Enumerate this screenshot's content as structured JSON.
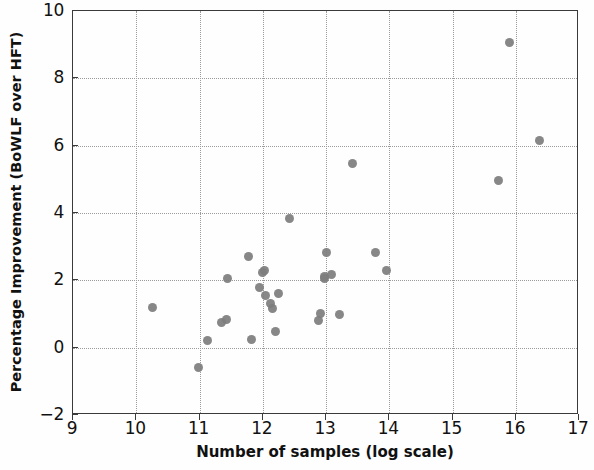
{
  "chart_data": {
    "type": "scatter",
    "title": "",
    "xlabel": "Number of samples (log scale)",
    "ylabel": "Percentage Improvement (BoWLF over HFT)",
    "xlim": [
      9,
      17
    ],
    "ylim": [
      -2,
      10
    ],
    "xticks": [
      9,
      10,
      11,
      12,
      13,
      14,
      15,
      16,
      17
    ],
    "yticks": [
      -2,
      0,
      2,
      4,
      6,
      8,
      10
    ],
    "xtick_labels": [
      "9",
      "10",
      "11",
      "12",
      "13",
      "14",
      "15",
      "16",
      "17"
    ],
    "ytick_labels": [
      "-2",
      "0",
      "2",
      "4",
      "6",
      "8",
      "10"
    ],
    "grid": true,
    "grid_style": "dotted",
    "legend": null,
    "marker": {
      "shape": "circle",
      "color": "#7d7d7d",
      "size": 9
    },
    "points": [
      {
        "x": 10.25,
        "y": 1.2
      },
      {
        "x": 10.98,
        "y": -0.6
      },
      {
        "x": 11.12,
        "y": 0.2
      },
      {
        "x": 11.35,
        "y": 0.75
      },
      {
        "x": 11.42,
        "y": 0.85
      },
      {
        "x": 11.45,
        "y": 2.05
      },
      {
        "x": 11.78,
        "y": 2.7
      },
      {
        "x": 11.82,
        "y": 0.25
      },
      {
        "x": 11.95,
        "y": 1.78
      },
      {
        "x": 12.0,
        "y": 2.22
      },
      {
        "x": 12.02,
        "y": 2.3
      },
      {
        "x": 12.05,
        "y": 1.55
      },
      {
        "x": 12.13,
        "y": 1.3
      },
      {
        "x": 12.15,
        "y": 1.15
      },
      {
        "x": 12.2,
        "y": 0.48
      },
      {
        "x": 12.25,
        "y": 1.62
      },
      {
        "x": 12.42,
        "y": 3.85
      },
      {
        "x": 12.88,
        "y": 0.82
      },
      {
        "x": 12.92,
        "y": 1.02
      },
      {
        "x": 12.97,
        "y": 2.05
      },
      {
        "x": 12.98,
        "y": 2.12
      },
      {
        "x": 13.0,
        "y": 2.82
      },
      {
        "x": 13.08,
        "y": 2.18
      },
      {
        "x": 13.22,
        "y": 0.98
      },
      {
        "x": 13.42,
        "y": 5.48
      },
      {
        "x": 13.78,
        "y": 2.82
      },
      {
        "x": 13.95,
        "y": 2.28
      },
      {
        "x": 15.72,
        "y": 4.98
      },
      {
        "x": 15.9,
        "y": 9.05
      },
      {
        "x": 16.38,
        "y": 6.15
      }
    ]
  },
  "axes": {
    "frame_color": "#3a3a3a",
    "grid_color": "#9a9a9a",
    "background": "#fefefe"
  }
}
